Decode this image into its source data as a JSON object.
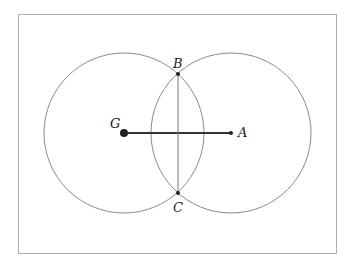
{
  "diagram": {
    "type": "geometric-construction",
    "frame": {
      "x": 18,
      "y": 14,
      "width": 318,
      "height": 239,
      "stroke": "#b0b0b0"
    },
    "colors": {
      "circle": "#8a8a8a",
      "segment": "#333333",
      "chord": "#7a7a7a",
      "point": "#222222"
    },
    "points": [
      {
        "id": "G",
        "label": "G",
        "x": 124,
        "y": 133,
        "r": 4,
        "label_x": 110,
        "label_y": 128
      },
      {
        "id": "A",
        "label": "A",
        "x": 231,
        "y": 133,
        "r": 2,
        "label_x": 238,
        "label_y": 137
      },
      {
        "id": "B",
        "label": "B",
        "x": 178,
        "y": 74,
        "r": 2,
        "label_x": 173,
        "label_y": 68
      },
      {
        "id": "C",
        "label": "C",
        "x": 178,
        "y": 193,
        "r": 2,
        "label_x": 173,
        "label_y": 212
      }
    ],
    "circles": [
      {
        "name": "circle-centered-G",
        "cx": 124,
        "cy": 133,
        "r": 80
      },
      {
        "name": "circle-centered-A",
        "cx": 231,
        "cy": 133,
        "r": 80
      }
    ],
    "segments": [
      {
        "name": "segment-GA",
        "from": "G",
        "to": "A",
        "width": 2
      },
      {
        "name": "segment-BC",
        "from": "B",
        "to": "C",
        "width": 1
      }
    ]
  }
}
